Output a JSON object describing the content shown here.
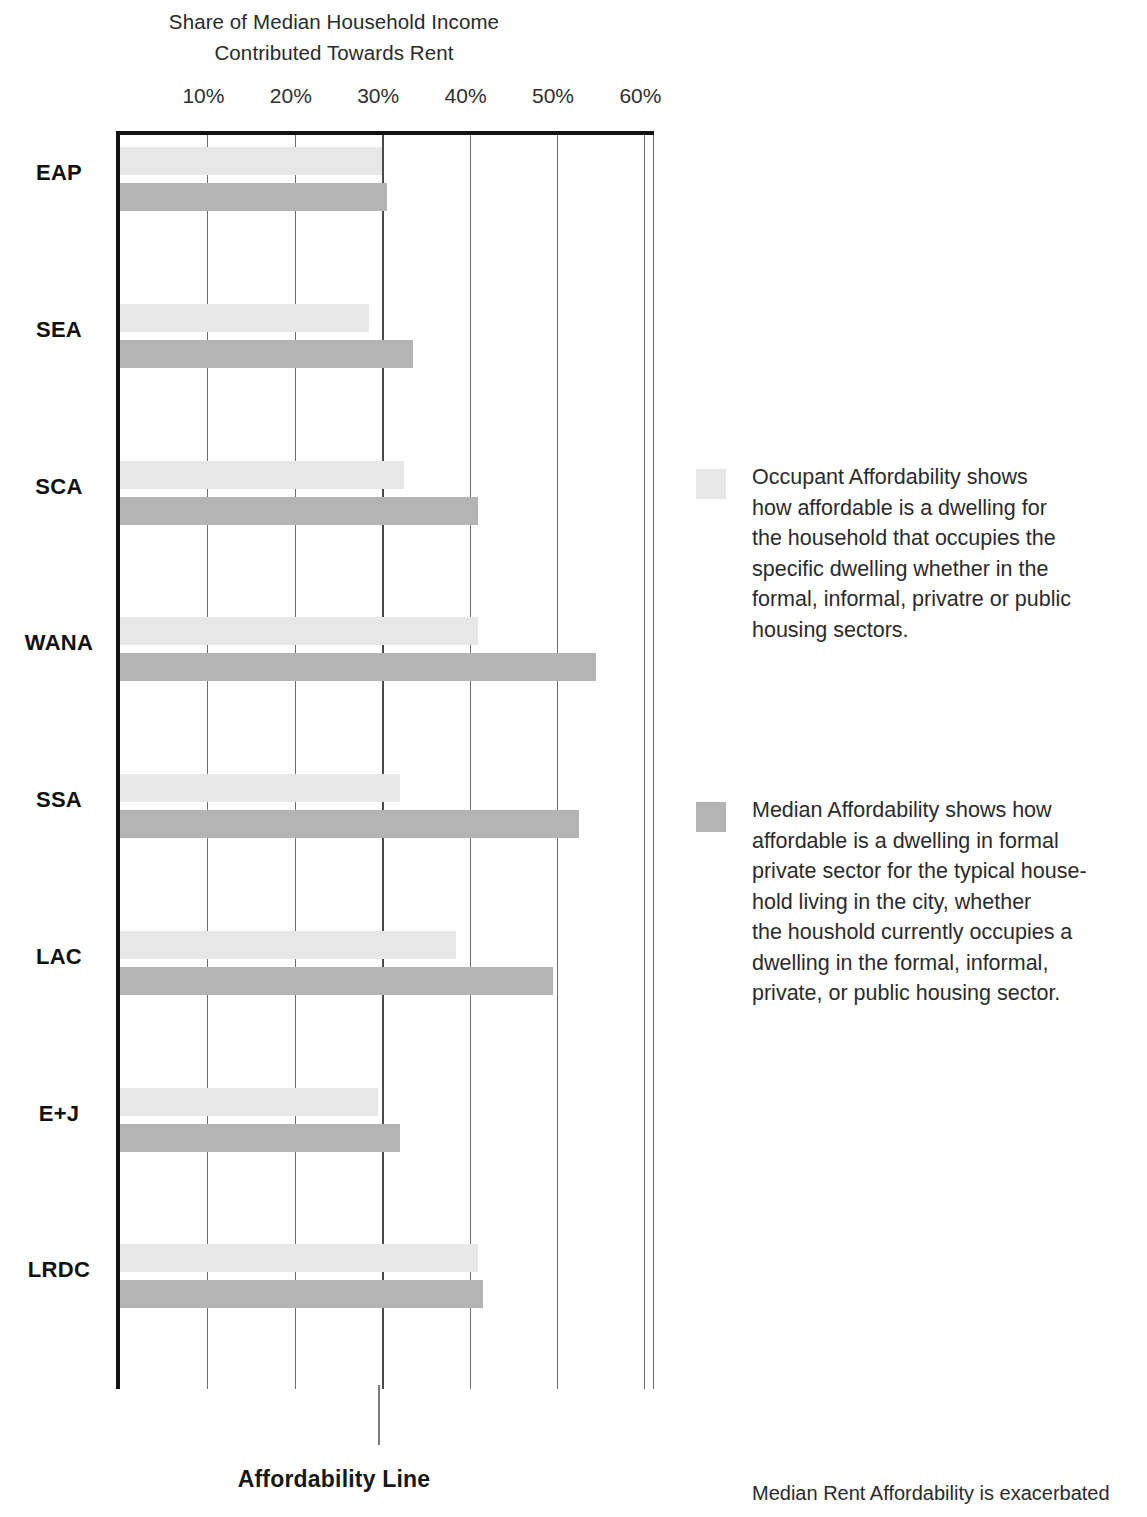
{
  "chart_data": {
    "type": "bar",
    "orientation": "horizontal",
    "title": "Share of Median Household Income Contributed Towards Rent",
    "title_lines": [
      "Share of Median Household Income",
      "Contributed Towards Rent"
    ],
    "xlabel": "",
    "ylabel": "",
    "xlim": [
      0,
      61
    ],
    "xticks": [
      10,
      20,
      30,
      40,
      50,
      60
    ],
    "xtick_labels": [
      "10%",
      "20%",
      "30%",
      "40%",
      "50%",
      "60%"
    ],
    "grid": true,
    "grid_axis": "x",
    "legend_position": "right",
    "categories": [
      "EAP",
      "SEA",
      "SCA",
      "WANA",
      "SSA",
      "LAC",
      "E+J",
      "LRDC"
    ],
    "series": [
      {
        "name": "Occupant Affordability",
        "color": "#e7e7e7",
        "values": [
          30,
          28.5,
          32.5,
          41,
          32,
          38.5,
          29.5,
          41
        ]
      },
      {
        "name": "Median Affordability",
        "color": "#b4b4b4",
        "values": [
          30.5,
          33.5,
          41,
          54.5,
          52.5,
          49.5,
          32,
          41.5
        ]
      }
    ],
    "annotations": [
      {
        "type": "vline",
        "value": 30,
        "label": "Affordability Line",
        "color": "#7c7c7c"
      }
    ]
  },
  "axis": {
    "tick_labels": [
      "10%",
      "20%",
      "30%",
      "40%",
      "50%",
      "60%"
    ],
    "category_labels": [
      "EAP",
      "SEA",
      "SCA",
      "WANA",
      "SSA",
      "LAC",
      "E+J",
      "LRDC"
    ]
  },
  "affordability_line": {
    "label": "Affordability Line",
    "value_percent": 30
  },
  "legend": {
    "items": [
      {
        "swatch_color": "#e7e7e7",
        "series": "Occupant Affordability",
        "lines": [
          "Occupant Affordability shows",
          "how affordable is a dwelling for",
          "the household that occupies the",
          "specific dwelling whether in the",
          "formal, informal, privatre or public",
          "housing sectors."
        ]
      },
      {
        "swatch_color": "#b4b4b4",
        "series": "Median Affordability",
        "lines": [
          "Median Affordability shows how",
          "affordable is a dwelling in formal",
          "private sector for the typical house-",
          "hold living in the city, whether",
          "the houshold currently occupies a",
          "dwelling in the formal, informal,",
          "private, or public housing sector."
        ]
      }
    ]
  },
  "footnote": {
    "text": "Median Rent Affordability is exacerbated"
  },
  "colors": {
    "occupant": "#e7e7e7",
    "median": "#b4b4b4",
    "axis": "#121212",
    "gridline": "#6d6d6d",
    "affordability_line": "#7c7c7c"
  }
}
